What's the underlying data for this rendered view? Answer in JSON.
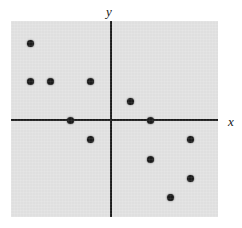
{
  "figure": {
    "background_color": "#ffffff",
    "panel_color": "#e2e2e2",
    "point_color": "#1a1a1a",
    "axis_color": "#1b1b1b"
  },
  "axes": {
    "x_label": "x",
    "y_label": "y"
  },
  "chart_data": {
    "type": "scatter",
    "title": "",
    "xlabel": "x",
    "ylabel": "y",
    "xlim": [
      -5,
      5.4
    ],
    "ylim": [
      -5,
      5.15
    ],
    "grid": false,
    "legend": false,
    "axis_style": "centered-cross",
    "tick_labels": {
      "x": [],
      "y": []
    },
    "series": [
      {
        "name": "points",
        "marker": "filled-circle",
        "color": "#1a1a1a",
        "points": [
          {
            "x": -4,
            "y": 4
          },
          {
            "x": -4,
            "y": 2
          },
          {
            "x": -3,
            "y": 2
          },
          {
            "x": -1,
            "y": 2
          },
          {
            "x": 1,
            "y": 1
          },
          {
            "x": -2,
            "y": 0
          },
          {
            "x": 2,
            "y": 0
          },
          {
            "x": -1,
            "y": -1
          },
          {
            "x": 4,
            "y": -1
          },
          {
            "x": 2,
            "y": -2
          },
          {
            "x": 4,
            "y": -3
          },
          {
            "x": 3,
            "y": -4
          }
        ]
      }
    ]
  }
}
